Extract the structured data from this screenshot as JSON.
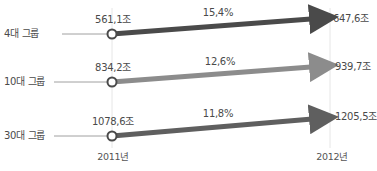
{
  "chart_data": {
    "type": "line",
    "title": "",
    "x": [
      "2011년",
      "2012년"
    ],
    "xlabel": "",
    "ylabel": "",
    "grid": "vertical",
    "legend": "none",
    "unit": "조",
    "series": [
      {
        "name": "4대 그룹",
        "values": [
          561.1,
          647.6
        ],
        "labels": [
          "561,1조",
          "647,6조"
        ],
        "growth": "15,4%",
        "color": "#4a4a4a"
      },
      {
        "name": "10대 그룹",
        "values": [
          834.2,
          939.7
        ],
        "labels": [
          "834,2조",
          "939,7조"
        ],
        "growth": "12,6%",
        "color": "#8c8c8c"
      },
      {
        "name": "30대 그룹",
        "values": [
          1078.6,
          1205.5
        ],
        "labels": [
          "1078,6조",
          "1205,5조"
        ],
        "growth": "11,8%",
        "color": "#5f5f5f"
      }
    ]
  },
  "colors": {
    "row1": "#4a4a4a",
    "row2": "#8c8c8c",
    "row3": "#5f5f5f",
    "leader": "#a0a0a0",
    "gridline": "#e6e6e6",
    "marker_fill": "#ffffff",
    "marker_stroke": "#4a4a4a"
  },
  "layout": {
    "x_start": 112,
    "x_end": 330,
    "rows": [
      {
        "y_start": 34,
        "y_end": 18,
        "label_y": 28,
        "leader_from": 62
      },
      {
        "y_start": 82,
        "y_end": 66,
        "label_y": 76,
        "leader_from": 54
      },
      {
        "y_start": 136,
        "y_end": 118,
        "label_y": 130,
        "leader_from": 54
      }
    ]
  }
}
